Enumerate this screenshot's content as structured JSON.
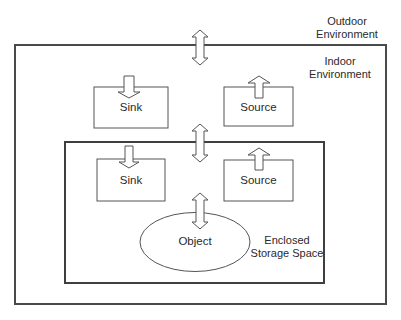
{
  "diagram": {
    "title": "",
    "colors": {
      "stroke": "#4a4a4a",
      "fill": "#ffffff",
      "text": "#2a2a2a"
    },
    "regions": {
      "outdoor": {
        "line1": "Outdoor",
        "line2": "Environment"
      },
      "indoor": {
        "line1": "Indoor",
        "line2": "Environment"
      },
      "enclosed": {
        "line1": "Enclosed",
        "line2": "Storage Space"
      }
    },
    "nodes": {
      "indoor_sink": {
        "label": "Sink"
      },
      "indoor_source": {
        "label": "Source"
      },
      "enclosed_sink": {
        "label": "Sink"
      },
      "enclosed_source": {
        "label": "Source"
      },
      "object": {
        "label": "Object"
      }
    },
    "edges": [
      {
        "from": "Outdoor Environment",
        "to": "Indoor Environment",
        "type": "bidirectional"
      },
      {
        "from": "Indoor Environment",
        "to": "Enclosed Storage Space",
        "type": "bidirectional"
      },
      {
        "from": "Enclosed Storage Space",
        "to": "Object",
        "type": "bidirectional"
      },
      {
        "from": "Indoor Environment",
        "to": "Sink",
        "type": "into"
      },
      {
        "from": "Source",
        "to": "Indoor Environment",
        "type": "out-of"
      },
      {
        "from": "Enclosed Storage Space",
        "to": "Sink",
        "type": "into"
      },
      {
        "from": "Source",
        "to": "Enclosed Storage Space",
        "type": "out-of"
      }
    ]
  }
}
